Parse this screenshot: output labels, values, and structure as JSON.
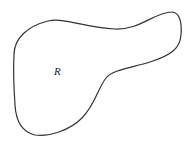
{
  "diagram": {
    "type": "closed-region",
    "region_label": "R",
    "stroke_color": "#333333",
    "fill_color": "#ffffff",
    "label_position": {
      "x": 54,
      "y": 66
    }
  }
}
